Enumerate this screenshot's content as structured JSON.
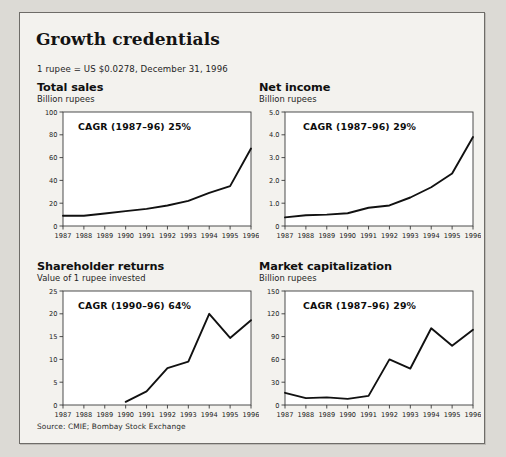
{
  "header": {
    "title": "Growth credentials",
    "note": "1 rupee = US $0.0278, December 31, 1996"
  },
  "source": "Source: CMIE; Bombay Stock Exchange",
  "panels": [
    {
      "title": "Total sales",
      "subtitle": "Billion rupees"
    },
    {
      "title": "Net income",
      "subtitle": "Billion rupees"
    },
    {
      "title": "Shareholder returns",
      "subtitle": "Value of 1 rupee invested"
    },
    {
      "title": "Market capitalization",
      "subtitle": "Billion rupees"
    }
  ],
  "chart_data": [
    {
      "type": "line",
      "title": "Total sales",
      "subtitle": "Billion rupees",
      "annotation": "CAGR (1987–96) 25%",
      "xlabel": "",
      "ylabel": "Billion rupees",
      "categories": [
        "1987",
        "1988",
        "1989",
        "1990",
        "1991",
        "1992",
        "1993",
        "1994",
        "1995",
        "1996"
      ],
      "values": [
        9,
        9,
        11,
        13,
        15,
        18,
        22,
        29,
        35,
        68
      ],
      "ylim": [
        0,
        100
      ],
      "yticks": [
        0,
        20,
        40,
        60,
        80,
        100
      ],
      "ytick_labels": [
        "0",
        "20",
        "40",
        "60",
        "80",
        "100"
      ],
      "grid": false,
      "legend": "none"
    },
    {
      "type": "line",
      "title": "Net income",
      "subtitle": "Billion rupees",
      "annotation": "CAGR (1987–96) 29%",
      "xlabel": "",
      "ylabel": "Billion rupees",
      "categories": [
        "1987",
        "1988",
        "1989",
        "1990",
        "1991",
        "1992",
        "1993",
        "1994",
        "1995",
        "1996"
      ],
      "values": [
        0.38,
        0.47,
        0.5,
        0.56,
        0.8,
        0.9,
        1.25,
        1.7,
        2.3,
        3.9
      ],
      "ylim": [
        0,
        5.0
      ],
      "yticks": [
        0,
        1.0,
        2.0,
        3.0,
        4.0,
        5.0
      ],
      "ytick_labels": [
        "0",
        "1.0",
        "2.0",
        "3.0",
        "4.0",
        "5.0"
      ],
      "grid": false,
      "legend": "none"
    },
    {
      "type": "line",
      "title": "Shareholder returns",
      "subtitle": "Value of 1 rupee invested",
      "annotation": "CAGR (1990–96) 64%",
      "xlabel": "",
      "ylabel": "Value of 1 rupee invested",
      "categories": [
        "1987",
        "1988",
        "1989",
        "1990",
        "1991",
        "1992",
        "1993",
        "1994",
        "1995",
        "1996"
      ],
      "values": [
        null,
        null,
        null,
        0.7,
        3.0,
        8.1,
        9.5,
        20.0,
        14.7,
        18.6
      ],
      "ylim": [
        0,
        25
      ],
      "yticks": [
        0,
        5,
        10,
        15,
        20,
        25
      ],
      "ytick_labels": [
        "0",
        "5",
        "10",
        "15",
        "20",
        "25"
      ],
      "grid": false,
      "legend": "none"
    },
    {
      "type": "line",
      "title": "Market capitalization",
      "subtitle": "Billion rupees",
      "annotation": "CAGR (1987–96) 29%",
      "xlabel": "",
      "ylabel": "Billion rupees",
      "categories": [
        "1987",
        "1988",
        "1989",
        "1990",
        "1991",
        "1992",
        "1993",
        "1994",
        "1995",
        "1996"
      ],
      "values": [
        16,
        9,
        10,
        8,
        12,
        60,
        48,
        101,
        78,
        99
      ],
      "ylim": [
        0,
        150
      ],
      "yticks": [
        0,
        30,
        60,
        90,
        120,
        150
      ],
      "ytick_labels": [
        "0",
        "30",
        "60",
        "90",
        "120",
        "150"
      ],
      "grid": false,
      "legend": "none"
    }
  ]
}
